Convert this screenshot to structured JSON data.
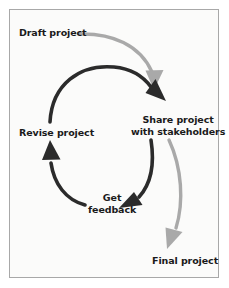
{
  "diagram": {
    "type": "cycle-flow",
    "title": "",
    "colors": {
      "background": "#fbfbfa",
      "border": "#a8a8a8",
      "text": "#1a1a1a",
      "cycle_arrow": "#2b2b2b",
      "linear_arrow": "#a9a9a9"
    },
    "nodes": [
      {
        "id": "draft-project",
        "label": "Draft project"
      },
      {
        "id": "share-project",
        "label_line1": "Share project",
        "label_line2": "with stakeholders"
      },
      {
        "id": "revise-project",
        "label": "Revise project"
      },
      {
        "id": "get-feedback",
        "label_line1": "Get",
        "label_line2": "feedback"
      },
      {
        "id": "final-project",
        "label": "Final project"
      }
    ],
    "edges": [
      {
        "id": "draft-to-share",
        "from": "draft-project",
        "to": "share-project",
        "style": "light-gray"
      },
      {
        "id": "share-to-feedback",
        "from": "share-project",
        "to": "get-feedback",
        "style": "dark"
      },
      {
        "id": "feedback-to-revise",
        "from": "get-feedback",
        "to": "revise-project",
        "style": "dark"
      },
      {
        "id": "revise-to-share",
        "from": "revise-project",
        "to": "share-project",
        "style": "dark"
      },
      {
        "id": "share-to-final",
        "from": "share-project",
        "to": "final-project",
        "style": "light-gray"
      }
    ]
  }
}
